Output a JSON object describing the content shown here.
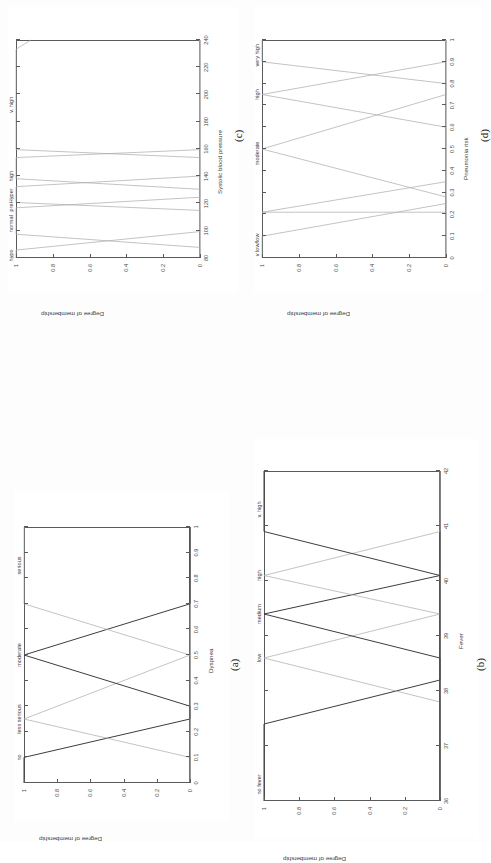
{
  "figure": {
    "shared_ylabel": "Degree of membership",
    "shared_yticks": [
      "0",
      "0.2",
      "0.4",
      "0.6",
      "0.8",
      "1"
    ]
  },
  "chart_data": [
    {
      "id": "a",
      "caption": "(a)",
      "type": "line",
      "title": "",
      "xlabel": "Dyspnea",
      "ylabel": "Degree of membership",
      "xlim": [
        0,
        1
      ],
      "ylim": [
        0,
        1
      ],
      "xticks": [
        "0",
        "0.1",
        "0.2",
        "0.3",
        "0.4",
        "0.5",
        "0.6",
        "0.7",
        "0.8",
        "0.9",
        "1"
      ],
      "yticks": [
        "0",
        "0.2",
        "0.4",
        "0.6",
        "0.8",
        "1"
      ],
      "grid": false,
      "legend": "in-plot set labels above peaks",
      "series": [
        {
          "name": "no",
          "label_x": 0.1,
          "points": [
            [
              0.0,
              1.0
            ],
            [
              0.1,
              1.0
            ],
            [
              0.25,
              0.0
            ],
            [
              1.0,
              0.0
            ]
          ]
        },
        {
          "name": "less serious",
          "label_x": 0.25,
          "points": [
            [
              0.0,
              0.0
            ],
            [
              0.1,
              0.0
            ],
            [
              0.25,
              1.0
            ],
            [
              0.5,
              0.0
            ],
            [
              1.0,
              0.0
            ]
          ]
        },
        {
          "name": "moderate",
          "label_x": 0.5,
          "points": [
            [
              0.0,
              0.0
            ],
            [
              0.3,
              0.0
            ],
            [
              0.5,
              1.0
            ],
            [
              0.7,
              0.0
            ],
            [
              1.0,
              0.0
            ]
          ]
        },
        {
          "name": "serious",
          "label_x": 0.85,
          "points": [
            [
              0.0,
              0.0
            ],
            [
              0.5,
              0.0
            ],
            [
              0.7,
              1.0
            ],
            [
              1.0,
              1.0
            ]
          ]
        }
      ]
    },
    {
      "id": "b",
      "caption": "(b)",
      "type": "line",
      "title": "",
      "xlabel": "Fever",
      "ylabel": "Degree of membership",
      "xlim": [
        36,
        42
      ],
      "ylim": [
        0,
        1
      ],
      "xticks": [
        "36",
        "37",
        "38",
        "39",
        "40",
        "41",
        "42"
      ],
      "yticks": [
        "0",
        "0.2",
        "0.4",
        "0.6",
        "0.8",
        "1"
      ],
      "grid": false,
      "legend": "in-plot set labels above peaks",
      "series": [
        {
          "name": "no fever",
          "label_x": 36.3,
          "points": [
            [
              36.0,
              1.0
            ],
            [
              37.4,
              1.0
            ],
            [
              38.2,
              0.0
            ],
            [
              42.0,
              0.0
            ]
          ]
        },
        {
          "name": "low",
          "label_x": 38.6,
          "points": [
            [
              36.0,
              0.0
            ],
            [
              37.8,
              0.0
            ],
            [
              38.6,
              1.0
            ],
            [
              39.4,
              0.0
            ],
            [
              42.0,
              0.0
            ]
          ]
        },
        {
          "name": "medium",
          "label_x": 39.4,
          "points": [
            [
              36.0,
              0.0
            ],
            [
              38.6,
              0.0
            ],
            [
              39.4,
              1.0
            ],
            [
              40.1,
              0.0
            ],
            [
              42.0,
              0.0
            ]
          ]
        },
        {
          "name": "high",
          "label_x": 40.1,
          "points": [
            [
              36.0,
              0.0
            ],
            [
              39.4,
              0.0
            ],
            [
              40.1,
              1.0
            ],
            [
              40.9,
              0.0
            ],
            [
              42.0,
              0.0
            ]
          ]
        },
        {
          "name": "v. high",
          "label_x": 41.3,
          "points": [
            [
              36.0,
              0.0
            ],
            [
              40.1,
              0.0
            ],
            [
              40.9,
              1.0
            ],
            [
              42.0,
              1.0
            ]
          ]
        }
      ]
    },
    {
      "id": "c",
      "caption": "(c)",
      "type": "line",
      "title": "",
      "xlabel": "Systolic blood pressure",
      "ylabel": "Degree of membership",
      "xlim": [
        80,
        245
      ],
      "ylim": [
        0,
        1
      ],
      "xticks": [
        "80",
        "100",
        "120",
        "140",
        "160",
        "180",
        "200",
        "220",
        "240"
      ],
      "yticks": [
        "0",
        "0.2",
        "0.4",
        "0.6",
        "0.8",
        "1"
      ],
      "grid": false,
      "legend": "in-plot set labels above peaks",
      "series": [
        {
          "name": "hypo",
          "label_x": 82,
          "points": [
            [
              80,
              1.0
            ],
            [
              86,
              1.0
            ],
            [
              100,
              0.0
            ],
            [
              245,
              0.0
            ]
          ]
        },
        {
          "name": "normal",
          "label_x": 106,
          "points": [
            [
              80,
              0.0
            ],
            [
              88,
              0.0
            ],
            [
              98,
              1.0
            ],
            [
              118,
              1.0
            ],
            [
              126,
              0.0
            ],
            [
              245,
              0.0
            ]
          ]
        },
        {
          "name": "preHyper",
          "label_x": 124,
          "points": [
            [
              80,
              0.0
            ],
            [
              116,
              0.0
            ],
            [
              122,
              1.0
            ],
            [
              134,
              1.0
            ],
            [
              142,
              0.0
            ],
            [
              245,
              0.0
            ]
          ]
        },
        {
          "name": "high",
          "label_x": 142,
          "points": [
            [
              80,
              0.0
            ],
            [
              132,
              0.0
            ],
            [
              140,
              1.0
            ],
            [
              156,
              1.0
            ],
            [
              162,
              0.0
            ],
            [
              245,
              0.0
            ]
          ]
        },
        {
          "name": "v. high",
          "label_x": 196,
          "points": [
            [
              80,
              0.0
            ],
            [
              156,
              0.0
            ],
            [
              162,
              1.0
            ],
            [
              238,
              1.0
            ],
            [
              245,
              0.92
            ]
          ]
        }
      ]
    },
    {
      "id": "d",
      "caption": "(d)",
      "type": "line",
      "title": "",
      "xlabel": "Pneumonia risk",
      "ylabel": "Degree of membership",
      "xlim": [
        0,
        1
      ],
      "ylim": [
        0,
        1
      ],
      "xticks": [
        "0",
        "0.1",
        "0.2",
        "0.3",
        "0.4",
        "0.5",
        "0.6",
        "0.7",
        "0.8",
        "0.9",
        "1"
      ],
      "yticks": [
        "0",
        "0.2",
        "0.4",
        "0.6",
        "0.8",
        "1"
      ],
      "grid": false,
      "legend": "in-plot set labels above peaks",
      "series": [
        {
          "name": "v low/low",
          "label_x": 0.06,
          "points": [
            [
              0.0,
              1.0
            ],
            [
              0.1,
              1.0
            ],
            [
              0.25,
              0.0
            ],
            [
              1.0,
              0.0
            ]
          ]
        },
        {
          "name": "moderate",
          "label_x": 0.48,
          "points": [
            [
              0.0,
              0.0
            ],
            [
              0.21,
              0.0
            ],
            [
              0.21,
              1.0
            ],
            [
              0.35,
              0.0
            ],
            [
              1.0,
              0.0
            ]
          ]
        },
        {
          "name": "high",
          "label_x": 0.75,
          "points": [
            [
              0.0,
              0.0
            ],
            [
              0.28,
              0.0
            ],
            [
              0.5,
              1.0
            ],
            [
              0.75,
              0.0
            ],
            [
              1.0,
              0.0
            ]
          ]
        },
        {
          "name": "very high",
          "label_x": 0.93,
          "points": [
            [
              0.0,
              0.0
            ],
            [
              0.6,
              0.0
            ],
            [
              0.75,
              1.0
            ],
            [
              0.9,
              0.0
            ],
            [
              1.0,
              0.0
            ]
          ]
        },
        {
          "name": "tail",
          "label_x": 0.97,
          "points": [
            [
              0.0,
              0.0
            ],
            [
              0.8,
              0.0
            ],
            [
              0.9,
              1.0
            ],
            [
              1.0,
              1.0
            ]
          ]
        }
      ]
    }
  ]
}
